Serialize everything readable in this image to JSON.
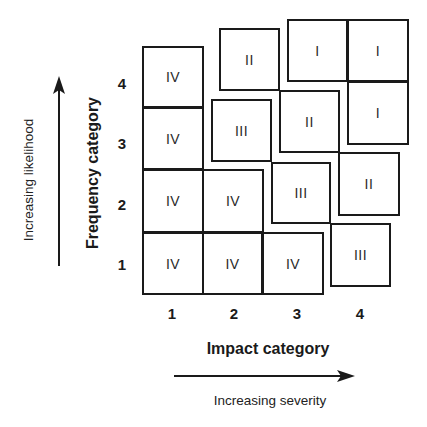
{
  "diagram": {
    "x_axis": {
      "title": "Impact category",
      "subtitle": "Increasing severity",
      "ticks": [
        "1",
        "2",
        "3",
        "4"
      ]
    },
    "y_axis": {
      "title": "Frequency category",
      "subtitle": "Increasing likelihood",
      "ticks": [
        "1",
        "2",
        "3",
        "4"
      ]
    },
    "cells": [
      {
        "impact": 1,
        "frequency": 4,
        "class": "IV",
        "x": 142,
        "y": 46,
        "w": 62,
        "h": 62
      },
      {
        "impact": 1,
        "frequency": 3,
        "class": "IV",
        "x": 142,
        "y": 107,
        "w": 62,
        "h": 63
      },
      {
        "impact": 1,
        "frequency": 2,
        "class": "IV",
        "x": 142,
        "y": 169,
        "w": 62,
        "h": 64
      },
      {
        "impact": 1,
        "frequency": 1,
        "class": "IV",
        "x": 142,
        "y": 232,
        "w": 62,
        "h": 63
      },
      {
        "impact": 2,
        "frequency": 4,
        "class": "II",
        "x": 219,
        "y": 28,
        "w": 61,
        "h": 63
      },
      {
        "impact": 2,
        "frequency": 3,
        "class": "III",
        "x": 211,
        "y": 99,
        "w": 61,
        "h": 63
      },
      {
        "impact": 2,
        "frequency": 2,
        "class": "IV",
        "x": 202,
        "y": 169,
        "w": 62,
        "h": 64
      },
      {
        "impact": 2,
        "frequency": 1,
        "class": "IV",
        "x": 202,
        "y": 232,
        "w": 61,
        "h": 63
      },
      {
        "impact": 3,
        "frequency": 4,
        "class": "I",
        "x": 287,
        "y": 19,
        "w": 61,
        "h": 63
      },
      {
        "impact": 3,
        "frequency": 3,
        "class": "II",
        "x": 279,
        "y": 90,
        "w": 61,
        "h": 63
      },
      {
        "impact": 3,
        "frequency": 2,
        "class": "III",
        "x": 271,
        "y": 162,
        "w": 60,
        "h": 62
      },
      {
        "impact": 3,
        "frequency": 1,
        "class": "IV",
        "x": 262,
        "y": 232,
        "w": 62,
        "h": 63
      },
      {
        "impact": 4,
        "frequency": 4,
        "class": "I",
        "x": 347,
        "y": 19,
        "w": 62,
        "h": 63
      },
      {
        "impact": 4,
        "frequency": 3,
        "class": "I",
        "x": 347,
        "y": 81,
        "w": 62,
        "h": 64
      },
      {
        "impact": 4,
        "frequency": 2,
        "class": "II",
        "x": 338,
        "y": 152,
        "w": 62,
        "h": 64
      },
      {
        "impact": 4,
        "frequency": 1,
        "class": "III",
        "x": 330,
        "y": 223,
        "w": 61,
        "h": 64
      }
    ],
    "x_tick_positions": [
      172,
      234,
      297,
      360
    ],
    "y_tick_positions": [
      83,
      143,
      204,
      264
    ],
    "colors": {
      "line": "#1a1a1a",
      "background": "#ffffff"
    }
  }
}
